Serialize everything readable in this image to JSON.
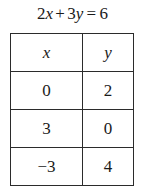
{
  "equation": {
    "full_text": "2x + 3y = 6",
    "left_coefficient": "2",
    "left_variable": "x",
    "operator": "+",
    "right_coefficient": "3",
    "right_variable": "y",
    "equals": "=",
    "constant": "6"
  },
  "table": {
    "headers": [
      "x",
      "y"
    ],
    "rows": [
      {
        "x": "0",
        "y": "2"
      },
      {
        "x": "3",
        "y": "0"
      },
      {
        "x": "−3",
        "y": "4"
      }
    ]
  },
  "chart_data": {
    "type": "table",
    "columns": [
      "x",
      "y"
    ],
    "values": [
      [
        0,
        2
      ],
      [
        3,
        0
      ],
      [
        -3,
        4
      ]
    ],
    "xlabel": "x",
    "ylabel": "y"
  },
  "colors": {
    "background": "#ffffff",
    "text": "#1a1a1a",
    "rule": "#2b2b2b"
  }
}
